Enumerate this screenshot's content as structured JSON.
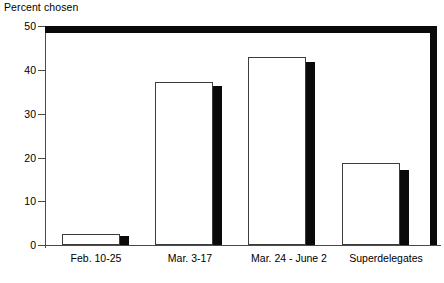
{
  "chart_data": {
    "type": "bar",
    "title": "Percent chosen",
    "xlabel": "",
    "ylabel": "Percent chosen",
    "ylim": [
      0,
      50
    ],
    "yticks": [
      0,
      10,
      20,
      30,
      40,
      50
    ],
    "ytick_labels": [
      "0",
      "10",
      "20",
      "30",
      "40",
      "50"
    ],
    "grid": false,
    "legend": "none",
    "categories": [
      "Feb. 10-25",
      "Mar. 3-17",
      "Mar. 24 - June 2",
      "Superdelegates"
    ],
    "series": [
      {
        "name": "open-bar",
        "style": "white-filled-black-outline",
        "values": [
          2.5,
          37.2,
          43.0,
          18.7
        ]
      },
      {
        "name": "solid-bar",
        "style": "solid-black",
        "values": [
          2.0,
          36.3,
          41.8,
          17.1
        ]
      }
    ]
  },
  "axis": {
    "y_labels": [
      "50",
      "40",
      "30",
      "20",
      "10",
      "0"
    ]
  },
  "colors": {
    "bar_open_fill": "#ffffff",
    "bar_open_stroke": "#3c3c3c",
    "bar_solid_fill": "#0a0a0a",
    "frame": "#0a0a0a",
    "axis": "#4a4a4a",
    "background": "#ffffff",
    "text": "#000000"
  }
}
